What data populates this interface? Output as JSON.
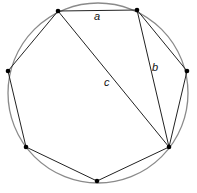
{
  "diagram": {
    "type": "inscribed-heptagon",
    "circle": {
      "cx": 98,
      "cy": 93,
      "r": 90,
      "stroke": "#8a8a8a"
    },
    "line_color": "#222222",
    "vertex_color": "#000000",
    "vertices": [
      {
        "x": 58,
        "y": 11
      },
      {
        "x": 137,
        "y": 10
      },
      {
        "x": 187,
        "y": 71
      },
      {
        "x": 169,
        "y": 147
      },
      {
        "x": 97,
        "y": 181
      },
      {
        "x": 26,
        "y": 147
      },
      {
        "x": 8,
        "y": 71
      }
    ],
    "labels": {
      "a": "a",
      "b": "b",
      "c": "c"
    }
  }
}
